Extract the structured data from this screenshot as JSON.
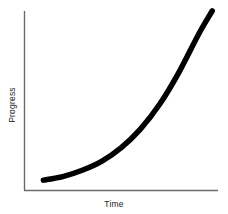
{
  "chart_data": {
    "type": "line",
    "title": "",
    "subtitle": "",
    "xlabel": "Time",
    "ylabel": "Progress",
    "legend": [],
    "annotations": [],
    "grid": false,
    "legend_position": "none",
    "xlim": [
      0,
      1
    ],
    "ylim": [
      0,
      1
    ],
    "xticks": [],
    "yticks": [],
    "xticklabels": [],
    "yticklabels": [],
    "series": [
      {
        "name": "Progress",
        "description": "exponential growth curve",
        "color": "#000000",
        "linewidth": 5.5,
        "x": [
          0.1,
          0.2,
          0.3,
          0.4,
          0.5,
          0.6,
          0.7,
          0.8,
          0.9,
          0.97
        ],
        "y": [
          0.055,
          0.075,
          0.11,
          0.16,
          0.235,
          0.34,
          0.48,
          0.66,
          0.87,
          1.0
        ]
      }
    ]
  },
  "chart": {
    "axis_color": "#6b6b6b",
    "curve_color": "#000000",
    "background_color": "#ffffff",
    "label_color": "#1a1a1a",
    "axis_origin_x": 24,
    "axis_origin_y": 190,
    "axis_top_y": 11,
    "axis_right_x": 218
  },
  "labels": {
    "x_axis": "Time",
    "y_axis": "Progress"
  }
}
